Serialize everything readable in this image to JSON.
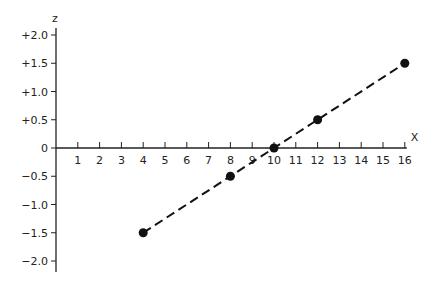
{
  "chart_data": {
    "type": "line",
    "title": "",
    "xlabel": "X",
    "ylabel": "z",
    "x_ticks": [
      1,
      2,
      3,
      4,
      5,
      6,
      7,
      8,
      9,
      10,
      11,
      12,
      13,
      14,
      15,
      16
    ],
    "y_ticks": [
      {
        "value": 2.0,
        "label": "+2.0"
      },
      {
        "value": 1.5,
        "label": "+1.5"
      },
      {
        "value": 1.0,
        "label": "+1.0"
      },
      {
        "value": 0.5,
        "label": "+0.5"
      },
      {
        "value": 0,
        "label": "0"
      },
      {
        "value": -0.5,
        "label": "-0.5"
      },
      {
        "value": -1.0,
        "label": "-1.0"
      },
      {
        "value": -1.5,
        "label": "-1.5"
      },
      {
        "value": -2.0,
        "label": "-2.0"
      }
    ],
    "xlim": [
      0,
      16
    ],
    "ylim": [
      -2.2,
      2.2
    ],
    "grid": false,
    "legend": null,
    "series": [
      {
        "name": "z vs X",
        "style": "dashed line with filled circle markers",
        "color": "#111111",
        "x": [
          4,
          8,
          10,
          12,
          16
        ],
        "y": [
          -1.5,
          -0.5,
          0,
          0.5,
          1.5
        ]
      }
    ]
  }
}
